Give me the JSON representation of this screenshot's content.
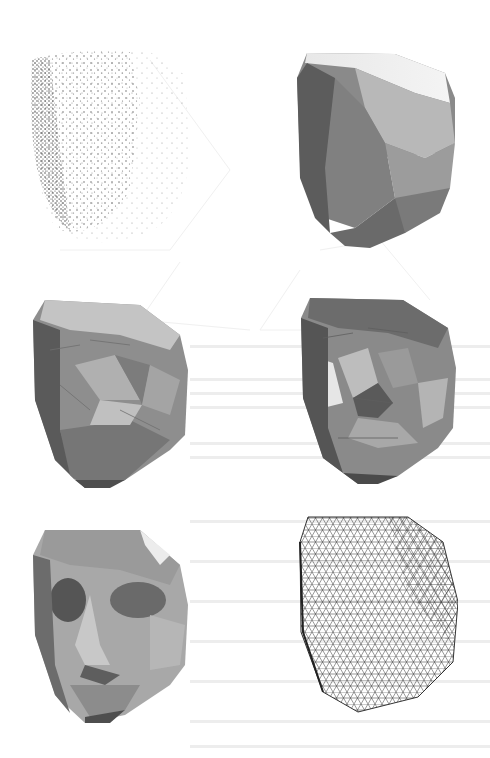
{
  "figure": {
    "panels": [
      {
        "id": "a",
        "content": "point-cloud",
        "position": "top-left"
      },
      {
        "id": "b",
        "content": "convex-hull-shaded",
        "position": "top-right"
      },
      {
        "id": "c",
        "content": "partially-sculpted-mesh",
        "position": "middle-left"
      },
      {
        "id": "d",
        "content": "further-sculpted-mesh",
        "position": "middle-right"
      },
      {
        "id": "e",
        "content": "final-shaded-mesh",
        "position": "bottom-left"
      },
      {
        "id": "f",
        "content": "wireframe-mesh",
        "position": "bottom-right"
      }
    ],
    "colors": {
      "background": "#ffffff",
      "points": "#3a3a3a",
      "mesh_dark": "#4a4a4a",
      "mesh_mid": "#8c8c8c",
      "mesh_light": "#d0d0d0",
      "wire": "#303030"
    }
  }
}
